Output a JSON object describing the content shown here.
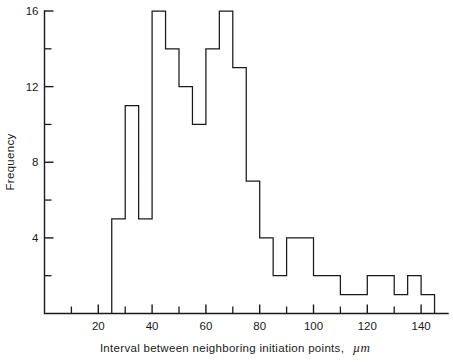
{
  "chart_data": {
    "type": "bar",
    "title": "",
    "subtitle": "",
    "xlabel": "Interval between neighboring initiation points, µm",
    "xlabel_text": "Interval between neighboring initiation points,",
    "xlabel_unit": "µm",
    "ylabel": "Frequency",
    "bin_width": 5,
    "bin_start": 25,
    "bin_end": 130,
    "categories": [
      "25–30",
      "30–35",
      "35–40",
      "40–45",
      "45–50",
      "50–55",
      "55–60",
      "60–65",
      "65–70",
      "70–75",
      "75–80",
      "80–85",
      "85–90",
      "90–95",
      "95–100",
      "100–105",
      "105–110",
      "110–115",
      "115–120",
      "120–125",
      "125–130",
      "130–135",
      "135–140",
      "140–145"
    ],
    "bin_edges": [
      25,
      30,
      35,
      40,
      45,
      50,
      55,
      60,
      65,
      70,
      75,
      80,
      85,
      90,
      95,
      100,
      105,
      110,
      115,
      120,
      125,
      130,
      135,
      140,
      145
    ],
    "values": [
      5,
      11,
      5,
      16,
      14,
      12,
      10,
      14,
      16,
      13,
      7,
      4,
      2,
      4,
      4,
      2,
      2,
      1,
      1,
      2,
      2,
      1,
      2,
      1
    ],
    "xlim": [
      0,
      150
    ],
    "ylim": [
      0,
      16
    ],
    "x_ticks_major": [
      20,
      40,
      60,
      80,
      100,
      120,
      140
    ],
    "x_ticks_minor": [
      10,
      30,
      50,
      70,
      90,
      110,
      130
    ],
    "x_tick_labels": [
      "20",
      "40",
      "60",
      "80",
      "100",
      "120",
      "140"
    ],
    "y_ticks_major": [
      4,
      8,
      12,
      16
    ],
    "y_ticks_minor": [
      2,
      6,
      10,
      14
    ],
    "y_tick_labels": [
      "4",
      "8",
      "12",
      "16"
    ],
    "grid": false,
    "legend": "none",
    "line_color": "#1a1a1a",
    "background_color": "#ffffff"
  }
}
